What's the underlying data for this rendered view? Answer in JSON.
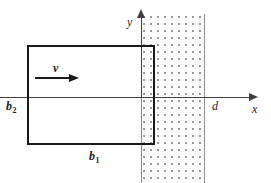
{
  "figure": {
    "background_color": "#ffffff"
  },
  "axes": {
    "x_label": "x",
    "y_label": "y",
    "axis_color": "#404040",
    "x_axis": {
      "from_px": 0,
      "to_px": 252,
      "y_px": 97
    },
    "y_axis": {
      "from_px": 97,
      "to_px": 16,
      "x_px": 141
    }
  },
  "field_region": {
    "name": "magnetic-field-region",
    "fill_pattern": "dots",
    "dot_color": "#9a9a9a",
    "edge_color": "#8c8c8c",
    "left_boundary_label": "y-axis (x = 0)",
    "right_boundary_label": "d"
  },
  "loop": {
    "name": "conducting-loop",
    "stroke_color": "#1a1a1a",
    "width_label": "b1",
    "height_label": "b2",
    "left_px": 27,
    "top_px": 45,
    "width_px": 128,
    "height_px": 100
  },
  "velocity": {
    "symbol": "v",
    "direction": "right",
    "color": "#1a1a1a"
  },
  "labels": {
    "v": "v",
    "b1_base": "b",
    "b1_sub": "1",
    "b2_base": "b",
    "b2_sub": "2",
    "d": "d",
    "x": "x",
    "y": "y"
  }
}
